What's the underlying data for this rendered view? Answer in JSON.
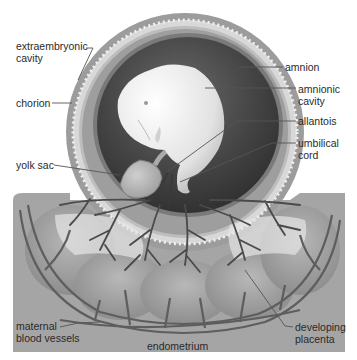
{
  "diagram": {
    "colors": {
      "background": "#ffffff",
      "endometrium": "#a3a3a3",
      "chorion_outer": "#9a9a9a",
      "chorion_band": "#d6d6d6",
      "amnionic_cavity": "#3e3e3e",
      "embryo": "#e8e8e8",
      "vessel": "#5a5a5a",
      "label_text": "#2a2a2a",
      "leader_line": "#555555"
    },
    "labels": {
      "extraembryonic_cavity": [
        "extraembryonic",
        "cavity"
      ],
      "chorion": [
        "chorion"
      ],
      "yolk_sac": [
        "yolk sac"
      ],
      "amnion": [
        "amnion"
      ],
      "amnionic_cavity": [
        "amnionic",
        "cavity"
      ],
      "allantois": [
        "allantois"
      ],
      "umbilical_cord": [
        "umbilical",
        "cord"
      ],
      "maternal_blood_vessels": [
        "maternal",
        "blood vessels"
      ],
      "endometrium": [
        "endometrium"
      ],
      "developing_placenta": [
        "developing",
        "placenta"
      ]
    }
  }
}
